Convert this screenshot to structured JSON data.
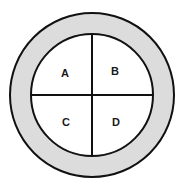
{
  "diagram": {
    "type": "ring-with-quadrants",
    "ring_fill": "#dcdcdc",
    "inner_fill": "#ffffff",
    "stroke": "#111111",
    "quadrants": [
      {
        "label": "A",
        "position": "top-left"
      },
      {
        "label": "B",
        "position": "top-right"
      },
      {
        "label": "C",
        "position": "bottom-left"
      },
      {
        "label": "D",
        "position": "bottom-right"
      }
    ]
  }
}
